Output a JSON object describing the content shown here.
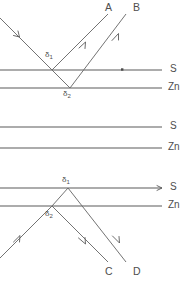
{
  "figure": {
    "width": 189,
    "height": 281,
    "background_color": "#ffffff",
    "line_color": "#5a5a5a",
    "ray_color": "#6b6b6b",
    "text_color": "#4e4e4e"
  },
  "ray_labels": {
    "a": "A",
    "b": "B",
    "c": "C",
    "d": "D"
  },
  "plane_labels": {
    "top_s": "S",
    "top_zn": "Zn",
    "middle_s": "S",
    "middle_zn": "Zn",
    "bottom_s": "S",
    "bottom_zn": "Zn"
  },
  "path_difference_labels": {
    "top_delta1": "δ",
    "top_delta1_sub": "1",
    "top_delta2": "δ",
    "top_delta2_sub": "2",
    "bottom_delta1": "δ",
    "bottom_delta1_sub": "1",
    "bottom_delta2": "δ",
    "bottom_delta2_sub": "2"
  },
  "geometry": {
    "top_group": {
      "s_plane_y": 70,
      "zn_plane_y": 88,
      "delta1_point": [
        52,
        70
      ],
      "delta2_point": [
        70,
        88
      ],
      "incident_start": [
        0,
        18
      ],
      "reflect_a_end": [
        108,
        14
      ],
      "reflect_b_end": [
        126,
        14
      ]
    },
    "middle_group": {
      "s_plane_y": 127,
      "zn_plane_y": 148
    },
    "bottom_group": {
      "s_plane_y": 188,
      "zn_plane_y": 206,
      "delta1_point": [
        68,
        188
      ],
      "delta2_point": [
        52,
        206
      ],
      "incident_start": [
        0,
        258
      ],
      "reflect_c_end": [
        108,
        262
      ],
      "reflect_d_end": [
        126,
        262
      ]
    },
    "plane_line_x_start": 0,
    "plane_line_x_end": 162,
    "tick_dot_top_s": [
      122,
      70
    ]
  }
}
